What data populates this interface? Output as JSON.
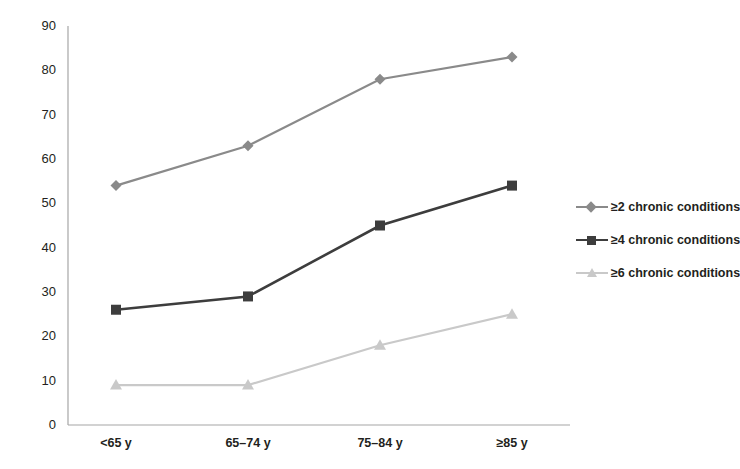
{
  "chart_data": {
    "type": "line",
    "title": "",
    "subtitle": "",
    "xlabel": "",
    "ylabel": "",
    "categories": [
      "<65 y",
      "65–74 y",
      "75–84 y",
      "≥85 y"
    ],
    "series": [
      {
        "name": "≥2 chronic conditions",
        "values": [
          54,
          63,
          78,
          83
        ],
        "color": "#8a8a8a",
        "marker": "diamond"
      },
      {
        "name": "≥4 chronic conditions",
        "values": [
          26,
          29,
          45,
          54
        ],
        "color": "#3d3d3d",
        "marker": "square"
      },
      {
        "name": "≥6 chronic conditions",
        "values": [
          9,
          9,
          18,
          25
        ],
        "color": "#c9c9c9",
        "marker": "triangle"
      }
    ],
    "ylim": [
      0,
      90
    ],
    "yticks": [
      0,
      10,
      20,
      30,
      40,
      50,
      60,
      70,
      80,
      90
    ],
    "ytick_labels": [
      "0",
      "10",
      "20",
      "30",
      "40",
      "50",
      "60",
      "70",
      "80",
      "90"
    ],
    "grid": false,
    "legend_position": "right",
    "axis_color": "#a6a6a6",
    "text_color": "#231f20",
    "background": "#ffffff"
  },
  "legend": {
    "items": [
      {
        "label": "≥2 chronic conditions"
      },
      {
        "label": "≥4 chronic conditions"
      },
      {
        "label": "≥6 chronic conditions"
      }
    ]
  },
  "axes": {
    "y": {
      "labels": [
        "90",
        "80",
        "70",
        "60",
        "50",
        "40",
        "30",
        "20",
        "10",
        "0"
      ]
    },
    "x": {
      "labels": [
        "<65 y",
        "65–74 y",
        "75–84 y",
        "≥85 y"
      ]
    }
  }
}
